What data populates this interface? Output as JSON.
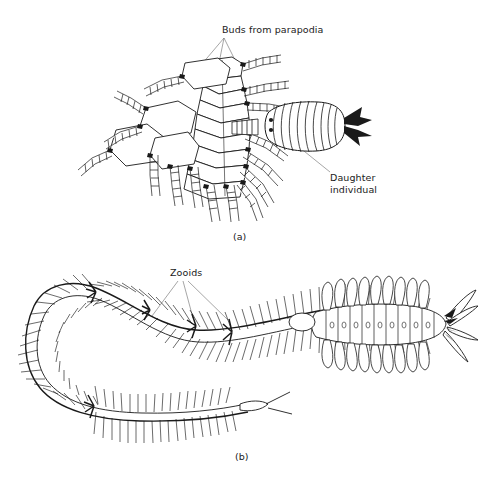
{
  "figure": {
    "background_color": "#ffffff",
    "ink_color": "#1a1a1a",
    "width": 483,
    "height": 478
  },
  "labels": {
    "buds_from_parapodia": "Buds from parapodia",
    "daughter_individual_line1": "Daughter",
    "daughter_individual_line2": "individual",
    "zooids": "Zooids",
    "panel_a": "(a)",
    "panel_b": "(b)"
  },
  "panels": [
    {
      "id": "a",
      "caption": "(a)",
      "callouts": [
        "Buds from parapodia",
        "Daughter individual"
      ]
    },
    {
      "id": "b",
      "caption": "(b)",
      "callouts": [
        "Zooids"
      ]
    }
  ],
  "panel_a_detail": {
    "segment_count": 8,
    "parapodia_per_segment": 2,
    "bud_count": 6,
    "daughter": {
      "eye_spots": 2,
      "segment_rings": 11,
      "tail_cirri": 2
    }
  },
  "panel_b_detail": {
    "zooid_count": 3,
    "form": "elongate chain, looped C-shape on the left, enlarged head end on the right",
    "head_tentacles": 6
  }
}
